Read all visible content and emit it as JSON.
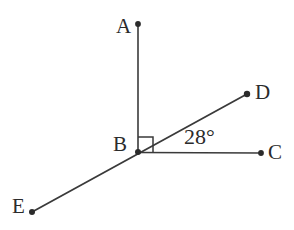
{
  "figure": {
    "type": "geometry-diagram",
    "width": 294,
    "height": 230,
    "background_color": "#ffffff",
    "stroke_color": "#3a3a3a",
    "text_color": "#2b2b2b",
    "stroke_width": 1.6,
    "dot_radius": 2.8
  },
  "points": {
    "A": {
      "label": "A",
      "x": 138,
      "y": 24,
      "label_x": 116,
      "label_y": 16
    },
    "B": {
      "label": "B",
      "x": 138,
      "y": 152,
      "label_x": 113,
      "label_y": 134
    },
    "C": {
      "label": "C",
      "x": 261,
      "y": 153,
      "label_x": 268,
      "label_y": 142
    },
    "D": {
      "label": "D",
      "x": 247,
      "y": 94,
      "label_x": 255,
      "label_y": 82
    },
    "E": {
      "label": "E",
      "x": 32,
      "y": 212,
      "label_x": 12,
      "label_y": 196
    }
  },
  "segments": [
    {
      "name": "ray-BA",
      "from": "B",
      "to": "A"
    },
    {
      "name": "ray-BC",
      "from": "B",
      "to": "C"
    },
    {
      "name": "line-EBD",
      "from": "E",
      "to": "D"
    }
  ],
  "right_angle": {
    "name": "right-angle-ABD",
    "vertex": "B",
    "size": 15,
    "marker": "square"
  },
  "angle_labels": [
    {
      "name": "angle-DBC",
      "text": "28°",
      "value": 28,
      "unit": "degrees",
      "x": 184,
      "y": 128
    }
  ]
}
